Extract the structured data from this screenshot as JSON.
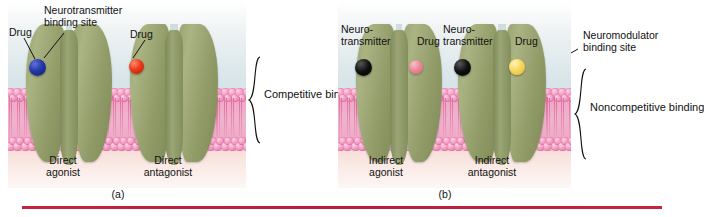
{
  "figure": {
    "accent_rule_color": "#bf1f39",
    "panels": [
      {
        "id": "a",
        "caption": "(a)",
        "binding_type": "Competitive binding",
        "labels": {
          "drug_left": "Drug",
          "binding_site": "Neurotransmitter\nbinding site",
          "drug_right": "Drug",
          "receptor_left": "Direct\nagonist",
          "receptor_right": "Direct\nantagonist"
        },
        "molecules": [
          {
            "name": "drug-agonist",
            "color": "#2438a8",
            "label": "Drug"
          },
          {
            "name": "drug-antagonist",
            "color": "#ea3a1c",
            "label": "Drug"
          }
        ]
      },
      {
        "id": "b",
        "caption": "(b)",
        "binding_type": "Noncompetitive binding",
        "labels": {
          "neurotransmitter_left": "Neuro-\ntransmitter",
          "drug_left": "Drug",
          "neurotransmitter_right": "Neuro-\ntransmitter",
          "drug_right": "Drug",
          "binding_site": "Neuromodulator\nbinding site",
          "receptor_left": "Indirect\nagonist",
          "receptor_right": "Indirect\nantagonist"
        },
        "molecules": [
          {
            "name": "neurotransmitter-1",
            "color": "#111111",
            "label": "Neuro-transmitter"
          },
          {
            "name": "drug-indirect-agonist",
            "color": "#f0869c",
            "label": "Drug"
          },
          {
            "name": "neurotransmitter-2",
            "color": "#111111",
            "label": "Neuro-transmitter"
          },
          {
            "name": "drug-indirect-antagonist",
            "color": "#f7d65c",
            "label": "Drug"
          }
        ]
      }
    ],
    "colors": {
      "receptor_protein": "#939d6a",
      "membrane_head": "#f0a9c6",
      "extracellular": "#cfe0e4",
      "intracellular": "#f4cfc7"
    }
  }
}
